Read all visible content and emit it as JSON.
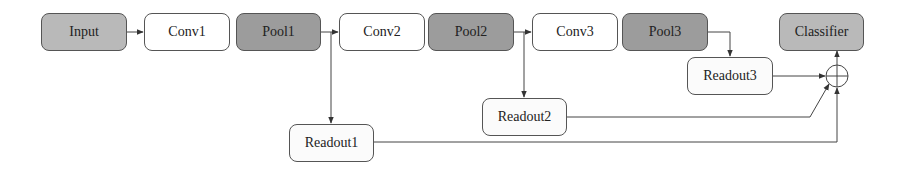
{
  "diagram": {
    "type": "network-architecture",
    "nodes": {
      "input": {
        "label": "Input",
        "fill": "#b9b9b9"
      },
      "conv1": {
        "label": "Conv1",
        "fill": "#ffffff"
      },
      "pool1": {
        "label": "Pool1",
        "fill": "#9c9c9c"
      },
      "conv2": {
        "label": "Conv2",
        "fill": "#ffffff"
      },
      "pool2": {
        "label": "Pool2",
        "fill": "#9c9c9c"
      },
      "conv3": {
        "label": "Conv3",
        "fill": "#ffffff"
      },
      "pool3": {
        "label": "Pool3",
        "fill": "#9c9c9c"
      },
      "classifier": {
        "label": "Classifier",
        "fill": "#b9b9b9"
      },
      "readout1": {
        "label": "Readout1",
        "fill": "#fbfbfb"
      },
      "readout2": {
        "label": "Readout2",
        "fill": "#fbfbfb"
      },
      "readout3": {
        "label": "Readout3",
        "fill": "#fbfbfb"
      },
      "sum": {
        "label": "",
        "symbol": "circle-plus"
      }
    },
    "edges": [
      {
        "from": "Input",
        "to": "Conv1"
      },
      {
        "from": "Pool1",
        "to": "Conv2"
      },
      {
        "from": "Pool1",
        "to": "Readout1"
      },
      {
        "from": "Pool2",
        "to": "Conv3"
      },
      {
        "from": "Pool2",
        "to": "Readout2"
      },
      {
        "from": "Pool3",
        "to": "Readout3"
      },
      {
        "from": "Readout3",
        "to": "Sum"
      },
      {
        "from": "Readout2",
        "to": "Sum"
      },
      {
        "from": "Readout1",
        "to": "Sum"
      },
      {
        "from": "Sum",
        "to": "Classifier"
      }
    ]
  }
}
